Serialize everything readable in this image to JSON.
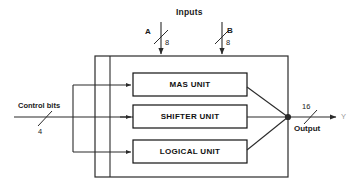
{
  "diagram": {
    "title": "Inputs",
    "enclosure": {
      "name": "processing-enclosure"
    },
    "inputs": [
      {
        "id": "a",
        "label": "A",
        "width": "8",
        "x": 161,
        "arrow_y_start": 22,
        "arrow_y_end": 56
      },
      {
        "id": "b",
        "label": "B",
        "width": "8",
        "x": 222,
        "arrow_y_start": 22,
        "arrow_y_end": 56
      }
    ],
    "control": {
      "label": "Control bits",
      "width": "4"
    },
    "units": [
      {
        "id": "mas",
        "label": "MAS UNIT",
        "y": 73
      },
      {
        "id": "shifter",
        "label": "SHIFTER UNIT",
        "y": 105
      },
      {
        "id": "logical",
        "label": "LOGICAL UNIT",
        "y": 140
      }
    ],
    "output": {
      "width": "16",
      "label": "Output",
      "signal": "Y"
    },
    "colors": {
      "line": "#2b2b2b",
      "block_border": "#111111",
      "text": "#1a1a1a",
      "muted_text": "#9a9a9a",
      "background": "#ffffff"
    }
  }
}
